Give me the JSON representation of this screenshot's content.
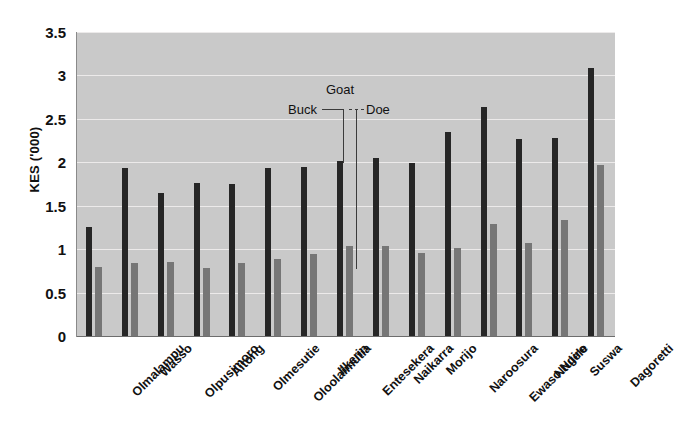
{
  "chart_data": {
    "type": "bar",
    "title": "",
    "subtitle": "",
    "xlabel": "",
    "ylabel": "KES ('000)",
    "ylim": [
      0,
      3.5
    ],
    "y_ticks": [
      0,
      0.5,
      1,
      1.5,
      2,
      2.5,
      3,
      3.5
    ],
    "y_tick_labels": [
      "0",
      "0.5",
      "1",
      "1.5",
      "2",
      "2.5",
      "3",
      "3.5"
    ],
    "grid": true,
    "legend_position": "inline-annotation",
    "categories": [
      "Olmalampu",
      "Wasso",
      "Olpusimoro",
      "Aitong",
      "Olmesutie",
      "Oloolaimutia",
      "Ilkerin",
      "Entesekera",
      "Naikarra",
      "Morijo",
      "Naroosura",
      "Ewaso Ngiro",
      "Ntulele",
      "Suswa",
      "Dagoretti"
    ],
    "series": [
      {
        "name": "Buck",
        "color": "#262626",
        "values": [
          1.25,
          1.94,
          1.65,
          1.76,
          1.75,
          1.94,
          1.95,
          2.01,
          2.05,
          1.99,
          2.35,
          2.64,
          2.27,
          2.28,
          3.08
        ]
      },
      {
        "name": "Doe",
        "color": "#767676",
        "values": [
          0.79,
          0.84,
          0.85,
          0.78,
          0.84,
          0.89,
          0.94,
          1.04,
          1.04,
          0.96,
          1.01,
          1.29,
          1.07,
          1.34,
          1.97
        ]
      }
    ],
    "annotations": [
      {
        "label": "Goat",
        "kind": "group-header"
      },
      {
        "label": "Buck",
        "kind": "series-pointer",
        "points_to": "Entesekera dark bar"
      },
      {
        "label": "Doe",
        "kind": "series-pointer",
        "points_to": "Entesekera light bar"
      }
    ]
  },
  "colors": {
    "plot_background": "#c9c9c9",
    "gridline": "#eceaea",
    "buck_bar": "#262626",
    "doe_bar": "#767676",
    "text": "#111111",
    "page_background": "#ffffff"
  },
  "annotation": {
    "goat": "Goat",
    "buck": "Buck",
    "doe": "Doe"
  },
  "axes": {
    "y_title": "KES ('000)"
  }
}
